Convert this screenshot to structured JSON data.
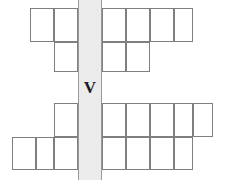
{
  "figure": {
    "name": "crossword-grid",
    "type": "crossword-puzzle-grid",
    "width": 225,
    "height": 180,
    "background_color": "#ffffff",
    "cell_border_color": "#7f7f7f",
    "cell_fill_color": "#ffffff",
    "highlight_fill_color": "#ebebeb",
    "highlight_border_color": "#9a9a9a",
    "letter_color": "#1a1a1a"
  },
  "highlight_column": {
    "label": "V",
    "name": "shaded-vertical-column",
    "x": 78,
    "y": 0,
    "width": 24,
    "height": 180,
    "letter_x": 78,
    "letter_y": 72,
    "letter_width": 24,
    "letter_height": 31
  },
  "rows": [
    {
      "index": 1,
      "y": 8,
      "height": 34,
      "cells": [
        {
          "x": 30,
          "width": 24
        },
        {
          "x": 54,
          "width": 24
        },
        {
          "x": 102,
          "width": 24
        },
        {
          "x": 126,
          "width": 24
        },
        {
          "x": 150,
          "width": 24
        },
        {
          "x": 174,
          "width": 19
        }
      ]
    },
    {
      "index": 2,
      "y": 42,
      "height": 30,
      "cells": [
        {
          "x": 54,
          "width": 24
        },
        {
          "x": 102,
          "width": 24
        },
        {
          "x": 126,
          "width": 24
        }
      ]
    },
    {
      "index": 3,
      "y": 103,
      "height": 34,
      "cells": [
        {
          "x": 54,
          "width": 24
        },
        {
          "x": 102,
          "width": 24
        },
        {
          "x": 126,
          "width": 24
        },
        {
          "x": 150,
          "width": 24
        },
        {
          "x": 174,
          "width": 19
        },
        {
          "x": 193,
          "width": 20
        }
      ]
    },
    {
      "index": 4,
      "y": 137,
      "height": 33,
      "cells": [
        {
          "x": 12,
          "width": 24
        },
        {
          "x": 36,
          "width": 18
        },
        {
          "x": 54,
          "width": 24
        },
        {
          "x": 102,
          "width": 24
        },
        {
          "x": 126,
          "width": 24
        },
        {
          "x": 150,
          "width": 24
        },
        {
          "x": 174,
          "width": 19
        }
      ]
    }
  ]
}
